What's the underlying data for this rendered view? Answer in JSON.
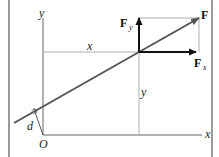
{
  "diagram": {
    "axes": {
      "x_label": "x",
      "y_label": "y",
      "origin_label": "O"
    },
    "distances": {
      "horizontal_label": "x",
      "vertical_label": "y",
      "moment_arm_label": "d"
    },
    "force": {
      "label": "F",
      "fx_label": "F",
      "fx_sub": "x",
      "fy_label": "F",
      "fy_sub": "y"
    },
    "colors": {
      "line_of_action": "#555555",
      "components": "#111111",
      "thin": "#888888",
      "frame": "#777777"
    }
  }
}
